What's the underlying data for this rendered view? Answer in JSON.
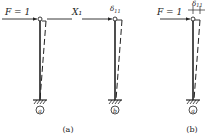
{
  "figure": {
    "panel_a": {
      "caption": "(a)",
      "load_label": "F = 1",
      "redundant_label": "X₁",
      "redundant_sub": "1",
      "displacement_label": "δ",
      "displacement_sub": "11",
      "support_a": "a",
      "support_b": "b"
    },
    "panel_b": {
      "caption": "(b)",
      "load_label": "F = 1",
      "displacement_label": "δ",
      "displacement_sub": "11",
      "support_a": "a"
    }
  }
}
